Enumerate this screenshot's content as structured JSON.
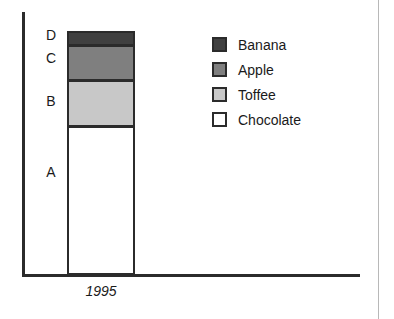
{
  "chart_data": {
    "type": "bar",
    "title": "",
    "xlabel": "",
    "ylabel": "",
    "categories": [
      "1995"
    ],
    "stacked": true,
    "grid": false,
    "legend_position": "right",
    "series": [
      {
        "name": "Chocolate",
        "group": "A",
        "values": [
          149
        ],
        "color": "#ffffff"
      },
      {
        "name": "Toffee",
        "group": "B",
        "values": [
          47
        ],
        "color": "#c8c8c8"
      },
      {
        "name": "Apple",
        "group": "C",
        "values": [
          36
        ],
        "color": "#7f7f7f"
      },
      {
        "name": "Banana",
        "group": "D",
        "values": [
          15
        ],
        "color": "#404040"
      }
    ],
    "segment_labels": [
      "D",
      "C",
      "B",
      "A"
    ],
    "tick_labels": [
      "1995"
    ]
  },
  "axes": {
    "x_tick_label": "1995"
  },
  "bar_groups": [
    {
      "label": "D",
      "series": "Banana",
      "color": "#404040"
    },
    {
      "label": "C",
      "series": "Apple",
      "color": "#7f7f7f"
    },
    {
      "label": "B",
      "series": "Toffee",
      "color": "#c8c8c8"
    },
    {
      "label": "A",
      "series": "Chocolate",
      "color": "#ffffff"
    }
  ],
  "legend": {
    "items": [
      {
        "label": "Banana",
        "color": "#404040"
      },
      {
        "label": "Apple",
        "color": "#7f7f7f"
      },
      {
        "label": "Toffee",
        "color": "#c8c8c8"
      },
      {
        "label": "Chocolate",
        "color": "#ffffff"
      }
    ]
  },
  "colors": {
    "axis": "#2b2b2b",
    "outline": "#2b2b2b",
    "frame": "#b8b8b8",
    "text": "#1a1a1a",
    "background": "#ffffff"
  }
}
